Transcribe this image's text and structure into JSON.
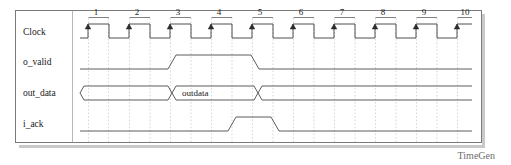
{
  "diagram": {
    "title": "TimeGen",
    "footer_label": "TimeGen",
    "type": "timing-diagram",
    "frame": {
      "x": 15,
      "y": 10,
      "width": 466,
      "height": 132
    },
    "label_column_width": 72,
    "time_axis": {
      "start_x": 88,
      "cycle_width": 41,
      "cycle_count": 10,
      "cycle_numbers": [
        "1",
        "2",
        "3",
        "4",
        "5",
        "6",
        "7",
        "8",
        "9",
        "10"
      ]
    },
    "colors": {
      "wave": "#4a4a4a",
      "clock": "#3a3a3a",
      "grid": "#bdbdbd",
      "frame": "#7a7a7a",
      "text": "#1a1a1a",
      "footer": "#6d6d6d",
      "background": "#ffffff"
    },
    "signals": [
      {
        "name": "Clock",
        "label": "Clock",
        "kind": "clock",
        "row_y": 32,
        "high_y": 24,
        "low_y": 38,
        "edge_arrows": true,
        "duty": 0.5
      },
      {
        "name": "o_valid",
        "label": "o_valid",
        "kind": "binary",
        "row_y": 62,
        "high_y": 55,
        "low_y": 69,
        "transitions": [
          {
            "x": 172,
            "to": "high"
          },
          {
            "x": 255,
            "to": "low"
          }
        ],
        "initial": "low"
      },
      {
        "name": "out_data",
        "label": "out_data",
        "kind": "bus",
        "row_y": 93,
        "high_y": 86,
        "low_y": 100,
        "segments": [
          {
            "from_x": 88,
            "to_x": 172,
            "value": ""
          },
          {
            "from_x": 172,
            "to_x": 258,
            "value": "outdata"
          },
          {
            "from_x": 258,
            "to_x": 472,
            "value": ""
          }
        ],
        "bus_value": "outdata"
      },
      {
        "name": "i_ack",
        "label": "i_ack",
        "kind": "binary",
        "row_y": 124,
        "high_y": 117,
        "low_y": 131,
        "transitions": [
          {
            "x": 232,
            "to": "high"
          },
          {
            "x": 275,
            "to": "low"
          }
        ],
        "initial": "low"
      }
    ]
  }
}
